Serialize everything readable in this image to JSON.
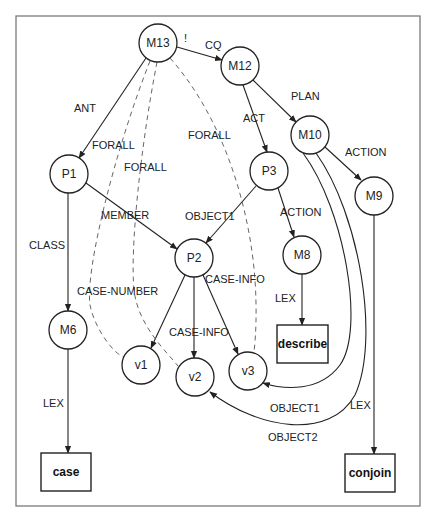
{
  "diagram": {
    "frame": {
      "x": 16,
      "y": 16,
      "w": 404,
      "h": 490
    },
    "nodes": [
      {
        "id": "M13",
        "label": "M13",
        "cx": 158,
        "cy": 43,
        "r": 19
      },
      {
        "id": "M12",
        "label": "M12",
        "cx": 240,
        "cy": 66,
        "r": 19
      },
      {
        "id": "M10",
        "label": "M10",
        "cx": 310,
        "cy": 135,
        "r": 19
      },
      {
        "id": "M9",
        "label": "M9",
        "cx": 374,
        "cy": 196,
        "r": 19
      },
      {
        "id": "P3",
        "label": "P3",
        "cx": 269,
        "cy": 171,
        "r": 19
      },
      {
        "id": "M8",
        "label": "M8",
        "cx": 302,
        "cy": 255,
        "r": 19
      },
      {
        "id": "P1",
        "label": "P1",
        "cx": 69,
        "cy": 174,
        "r": 19
      },
      {
        "id": "P2",
        "label": "P2",
        "cx": 194,
        "cy": 258,
        "r": 19
      },
      {
        "id": "M6",
        "label": "M6",
        "cx": 68,
        "cy": 330,
        "r": 19
      },
      {
        "id": "v1",
        "label": "v1",
        "cx": 141,
        "cy": 365,
        "r": 19
      },
      {
        "id": "v2",
        "label": "v2",
        "cx": 195,
        "cy": 377,
        "r": 19
      },
      {
        "id": "v3",
        "label": "v3",
        "cx": 248,
        "cy": 371,
        "r": 19
      }
    ],
    "boxes": [
      {
        "id": "describe",
        "label": "describe",
        "x": 277,
        "y": 325,
        "w": 51,
        "h": 38
      },
      {
        "id": "case",
        "label": "case",
        "x": 41,
        "y": 453,
        "w": 50,
        "h": 38
      },
      {
        "id": "conjoin",
        "label": "conjoin",
        "x": 345,
        "y": 454,
        "w": 50,
        "h": 38
      }
    ],
    "edges": [
      {
        "from": "M13",
        "to": "M12",
        "label": "CQ",
        "style": "solid",
        "d": "M177,47 L222,60",
        "lx": 205,
        "ly": 45
      },
      {
        "from": "M13",
        "to": "M13",
        "label": "!",
        "style": "none",
        "d": "",
        "lx": 184,
        "ly": 38
      },
      {
        "from": "M12",
        "to": "M10",
        "label": "PLAN",
        "style": "solid",
        "d": "M253,80 L296,122",
        "lx": 291,
        "ly": 96
      },
      {
        "from": "M12",
        "to": "P3",
        "label": "ACT",
        "style": "solid",
        "d": "M243,85 L267,152",
        "lx": 243,
        "ly": 118
      },
      {
        "from": "M13",
        "to": "P1",
        "label": "ANT",
        "style": "solid",
        "d": "M146,58 L79,158",
        "lx": 74,
        "ly": 108
      },
      {
        "from": "M10",
        "to": "M9",
        "label": "ACTION",
        "style": "solid",
        "d": "M325,147 L361,180",
        "lx": 345,
        "ly": 152
      },
      {
        "from": "P3",
        "to": "M8",
        "label": "ACTION",
        "style": "solid",
        "d": "M278,188 L294,237",
        "lx": 280,
        "ly": 212
      },
      {
        "from": "P3",
        "to": "P2",
        "label": "OBJECT1",
        "style": "solid",
        "d": "M256,186 L206,243",
        "lx": 185,
        "ly": 216
      },
      {
        "from": "P1",
        "to": "P2",
        "label": "MEMBER",
        "style": "solid",
        "d": "M86,183 L177,249",
        "lx": 101,
        "ly": 215
      },
      {
        "from": "P1",
        "to": "M6",
        "label": "CLASS",
        "style": "solid",
        "d": "M68,193 L68,311",
        "lx": 29,
        "ly": 245
      },
      {
        "from": "M8",
        "to": "describe",
        "label": "LEX",
        "style": "solid",
        "d": "M302,274 L302,325",
        "lx": 275,
        "ly": 298
      },
      {
        "from": "M6",
        "to": "case",
        "label": "LEX",
        "style": "solid",
        "d": "M68,349 L68,453",
        "lx": 43,
        "ly": 403
      },
      {
        "from": "M9",
        "to": "conjoin",
        "label": "LEX",
        "style": "solid",
        "d": "M374,215 L374,454",
        "lx": 350,
        "ly": 405
      },
      {
        "from": "P2",
        "to": "v1",
        "label": "",
        "style": "solid",
        "d": "M185,275 L151,348"
      },
      {
        "from": "P2",
        "to": "v2",
        "label": "CASE-INFO",
        "style": "solid",
        "d": "M194,277 L194,358",
        "lx": 169,
        "ly": 332
      },
      {
        "from": "P2",
        "to": "v3",
        "label": "",
        "style": "solid",
        "d": "M203,275 L238,354"
      },
      {
        "from": "M10",
        "to": "v3",
        "label": "OBJECT1",
        "style": "solid",
        "d": "M303,153 C345,210 365,330 340,365 C320,392 285,390 263,383",
        "lx": 270,
        "ly": 408
      },
      {
        "from": "M10",
        "to": "v2",
        "label": "OBJECT2",
        "style": "solid",
        "d": "M316,153 C360,215 380,340 355,395 C330,440 260,430 210,392",
        "lx": 268,
        "ly": 437
      },
      {
        "from": "M13",
        "to": "v1",
        "label": "FORALL",
        "style": "dashed",
        "d": "M150,61 C115,150 85,270 90,305 C95,330 115,355 124,357",
        "lx": 92,
        "ly": 145
      },
      {
        "from": "M13",
        "to": "v2",
        "label": "FORALL",
        "style": "dashed",
        "d": "M157,62 C140,150 130,250 134,290 C138,325 165,350 178,366",
        "lx": 124,
        "ly": 167
      },
      {
        "from": "M13",
        "to": "v3",
        "label": "FORALL",
        "style": "dashed",
        "d": "M170,58 C225,120 250,210 255,280 C257,310 256,335 254,352",
        "lx": 188,
        "ly": 135
      },
      {
        "from": "M6",
        "to": "v1",
        "label": "CASE-NUMBER",
        "style": "none",
        "d": "",
        "lx": 77,
        "ly": 291
      },
      {
        "from": "P3",
        "to": "v3",
        "label": "CASE-INFO",
        "style": "none",
        "d": "",
        "lx": 205,
        "ly": 279
      }
    ]
  }
}
